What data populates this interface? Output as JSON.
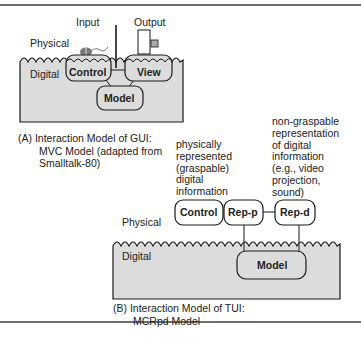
{
  "figure": {
    "diagram_a": {
      "labels": {
        "physical": "Physical",
        "digital": "Digital",
        "input": "Input",
        "output": "Output"
      },
      "nodes": {
        "control": "Control",
        "view": "View",
        "model": "Model"
      },
      "caption": {
        "prefix": "(A)",
        "line1": "Interaction Model of GUI:",
        "line2": "MVC Model (adapted from",
        "line3": "Smalltalk-80)"
      }
    },
    "diagram_b": {
      "labels": {
        "physical": "Physical",
        "digital": "Digital"
      },
      "annotations": {
        "rep_p": [
          "physically",
          "represented",
          "(graspable)",
          "digital",
          "information"
        ],
        "rep_d": [
          "non-graspable",
          "representation",
          "of digital",
          "information",
          "(e.g., video",
          "projection,",
          "sound)"
        ]
      },
      "nodes": {
        "control": "Control",
        "rep_p": "Rep-p",
        "rep_d": "Rep-d",
        "model": "Model"
      },
      "caption": {
        "prefix": "(B)",
        "line1": "Interaction Model of TUI:",
        "line2": "MCRpd Model"
      }
    },
    "colors": {
      "digital_fill": "#dcdcdc",
      "stroke": "#1a1a1a",
      "rule": "#6e6e6e"
    }
  }
}
